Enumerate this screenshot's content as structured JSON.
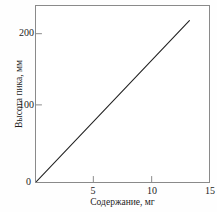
{
  "chart_data": {
    "type": "line",
    "title": "",
    "xlabel": "Содержание, мг",
    "ylabel": "Высота пика, мм",
    "xlim": [
      0,
      15
    ],
    "ylim": [
      0,
      240
    ],
    "xticks": [
      0,
      5,
      10,
      15
    ],
    "yticks": [
      0,
      100,
      200
    ],
    "xtick_labels": [
      "0",
      "5",
      "10",
      "15"
    ],
    "ytick_labels": [
      "0",
      "100",
      "200"
    ],
    "grid": false,
    "legend": null,
    "frame": "box",
    "tick_direction": "in",
    "series": [
      {
        "name": "Калибровочная прямая",
        "x": [
          0,
          13.3
        ],
        "y": [
          0,
          220
        ],
        "color": "#222222",
        "marker": "none",
        "linewidth": 1
      }
    ],
    "origin_label": "0",
    "colors": {
      "line": "#222222",
      "frame": "#8a8a8a",
      "text": "#1c1c1c",
      "background": "#ffffff"
    }
  }
}
